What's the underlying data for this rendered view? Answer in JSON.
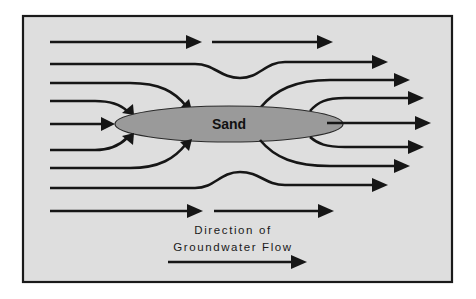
{
  "diagram": {
    "sand_label": "Sand",
    "legend": {
      "line1": "Direction of",
      "line2": "Groundwater Flow",
      "icon": "right-arrow-icon"
    },
    "colors": {
      "background": "#dedede",
      "frame": "#1a1a1a",
      "streamline": "#161616",
      "sand_fill": "#9a9a9a"
    },
    "streamline_count": 9
  }
}
